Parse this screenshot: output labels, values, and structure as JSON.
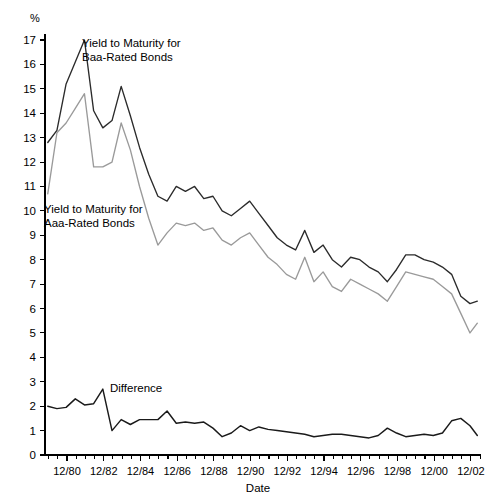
{
  "chart_data": {
    "type": "line",
    "title": "",
    "xlabel": "Date",
    "ylabel": "",
    "y_unit_label": "%",
    "ylim": [
      0,
      17
    ],
    "xlim": [
      1979.75,
      2003.5
    ],
    "grid": false,
    "legend_position": "inline-annotations",
    "y_ticks": [
      0,
      1,
      2,
      3,
      4,
      5,
      6,
      7,
      8,
      9,
      10,
      11,
      12,
      13,
      14,
      15,
      16,
      17
    ],
    "y_tick_labels": [
      "0",
      "1",
      "2",
      "3",
      "4",
      "5",
      "6",
      "7",
      "8",
      "9",
      "10",
      "11",
      "12",
      "13",
      "14",
      "15",
      "16",
      "17"
    ],
    "x_tick_labels": [
      "12/80",
      "12/82",
      "12/84",
      "12/86",
      "12/88",
      "12/90",
      "12/92",
      "12/94",
      "12/96",
      "12/98",
      "12/00",
      "12/02"
    ],
    "x_tick_values": [
      1980.95,
      1982.95,
      1984.95,
      1986.95,
      1988.95,
      1990.95,
      1992.95,
      1994.95,
      1996.95,
      1998.95,
      2000.95,
      2002.95
    ],
    "x_minor_interval": 0.5,
    "annotations": [
      {
        "name": "baa-label",
        "text_line1": "Yield to Maturity for",
        "text_line2": "Baa-Rated Bonds",
        "x_px": 82,
        "y_px": 47
      },
      {
        "name": "aaa-label",
        "text_line1": "Yield to Maturity for",
        "text_line2": "Aaa-Rated Bonds",
        "x_px": 44,
        "y_px": 213
      },
      {
        "name": "difference-label",
        "text_line1": "Difference",
        "text_line2": "",
        "x_px": 110,
        "y_px": 392
      }
    ],
    "x": [
      1979.9,
      1980.4,
      1980.9,
      1981.4,
      1981.9,
      1982.4,
      1982.9,
      1983.4,
      1983.9,
      1984.4,
      1984.9,
      1985.4,
      1985.9,
      1986.4,
      1986.9,
      1987.4,
      1987.9,
      1988.4,
      1988.9,
      1989.4,
      1989.9,
      1990.4,
      1990.9,
      1991.4,
      1991.9,
      1992.4,
      1992.9,
      1993.4,
      1993.9,
      1994.4,
      1994.9,
      1995.4,
      1995.9,
      1996.4,
      1996.9,
      1997.4,
      1997.9,
      1998.4,
      1998.9,
      1999.4,
      1999.9,
      2000.4,
      2000.9,
      2001.4,
      2001.9,
      2002.4,
      2002.9,
      2003.3
    ],
    "series": [
      {
        "name": "Yield to Maturity for Baa-Rated Bonds",
        "color": "#2b2b2b",
        "values": [
          12.8,
          13.3,
          15.2,
          16.1,
          17.0,
          14.1,
          13.4,
          13.7,
          15.1,
          13.9,
          12.6,
          11.5,
          10.6,
          10.4,
          11.0,
          10.8,
          11.0,
          10.5,
          10.6,
          10.0,
          9.8,
          10.1,
          10.4,
          9.9,
          9.4,
          8.9,
          8.6,
          8.4,
          9.2,
          8.3,
          8.6,
          8.0,
          7.7,
          8.1,
          8.0,
          7.7,
          7.5,
          7.1,
          7.6,
          8.2,
          8.2,
          8.0,
          7.9,
          7.7,
          7.4,
          6.5,
          6.2,
          6.3
        ]
      },
      {
        "name": "Yield to Maturity for Aaa-Rated Bonds",
        "color": "#9a9a9a",
        "values": [
          10.7,
          13.2,
          13.6,
          14.2,
          14.8,
          11.8,
          11.8,
          12.0,
          13.6,
          12.5,
          11.0,
          9.7,
          8.6,
          9.1,
          9.5,
          9.4,
          9.5,
          9.2,
          9.3,
          8.8,
          8.6,
          8.9,
          9.1,
          8.6,
          8.1,
          7.8,
          7.4,
          7.2,
          8.1,
          7.1,
          7.5,
          6.9,
          6.7,
          7.2,
          7.0,
          6.8,
          6.6,
          6.3,
          6.9,
          7.5,
          7.4,
          7.3,
          7.2,
          6.9,
          6.6,
          5.8,
          5.0,
          5.4
        ]
      },
      {
        "name": "Difference",
        "color": "#1a1a1a",
        "values": [
          2.0,
          1.9,
          1.95,
          2.3,
          2.05,
          2.1,
          2.7,
          1.0,
          1.45,
          1.25,
          1.45,
          1.45,
          1.45,
          1.8,
          1.3,
          1.35,
          1.3,
          1.35,
          1.1,
          0.75,
          0.9,
          1.2,
          1.0,
          1.15,
          1.05,
          1.0,
          0.95,
          0.9,
          0.85,
          0.75,
          0.8,
          0.85,
          0.85,
          0.8,
          0.75,
          0.7,
          0.8,
          1.1,
          0.9,
          0.75,
          0.8,
          0.85,
          0.8,
          0.9,
          1.4,
          1.5,
          1.2,
          0.8
        ]
      }
    ]
  }
}
